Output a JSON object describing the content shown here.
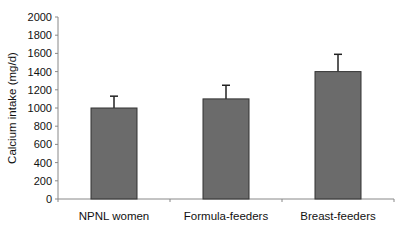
{
  "chart_data": {
    "type": "bar",
    "title": "",
    "xlabel": "",
    "ylabel": "Calcium intake (mg/d)",
    "ylim": [
      0,
      2000
    ],
    "yticks": [
      0,
      200,
      400,
      600,
      800,
      1000,
      1200,
      1400,
      1600,
      1800,
      2000
    ],
    "categories": [
      "NPNL women",
      "Formula-feeders",
      "Breast-feeders"
    ],
    "values": [
      1000,
      1100,
      1400
    ],
    "error_upper": [
      130,
      150,
      190
    ],
    "grid": false,
    "legend": null,
    "bar_color": "#6b6b6b"
  }
}
